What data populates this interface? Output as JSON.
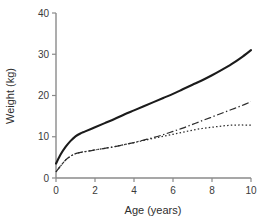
{
  "chart_data": {
    "type": "line",
    "title": "",
    "subtitle": "",
    "xlabel": "Age (years)",
    "ylabel": "Weight (kg)",
    "xlim": [
      0,
      10
    ],
    "ylim": [
      0,
      40
    ],
    "xticks": [
      0,
      2,
      4,
      6,
      8,
      10
    ],
    "yticks": [
      0,
      10,
      20,
      30,
      40
    ],
    "xtick_labels": [
      "0",
      "2",
      "4",
      "6",
      "8",
      "10"
    ],
    "ytick_labels": [
      "0",
      "10",
      "20",
      "30",
      "40"
    ],
    "grid": false,
    "legend": "none",
    "x": [
      0,
      0.25,
      0.5,
      0.75,
      1,
      1.25,
      1.5,
      2,
      2.5,
      3,
      3.5,
      4,
      4.5,
      5,
      5.5,
      6,
      6.5,
      7,
      7.5,
      8,
      8.5,
      9,
      9.5,
      10
    ],
    "series": [
      {
        "name": "solid-curve",
        "style": "solid",
        "color": "#1b1b1b",
        "values": [
          3.5,
          5.8,
          7.6,
          9.0,
          10.1,
          10.8,
          11.3,
          12.3,
          13.3,
          14.3,
          15.4,
          16.4,
          17.4,
          18.4,
          19.4,
          20.4,
          21.5,
          22.6,
          23.7,
          24.9,
          26.2,
          27.6,
          29.2,
          31.0
        ]
      },
      {
        "name": "dash-dot-curve",
        "style": "dash-dot",
        "color": "#2b2b2b",
        "values": [
          1.5,
          3.0,
          4.4,
          5.3,
          5.9,
          6.2,
          6.4,
          6.8,
          7.2,
          7.6,
          8.1,
          8.6,
          9.2,
          9.8,
          10.5,
          11.3,
          12.1,
          13.0,
          13.9,
          14.8,
          15.7,
          16.6,
          17.5,
          18.5
        ]
      },
      {
        "name": "dotted-curve",
        "style": "dotted",
        "color": "#2b2b2b",
        "values": [
          1.5,
          3.0,
          4.4,
          5.3,
          5.9,
          6.2,
          6.4,
          6.8,
          7.2,
          7.6,
          8.1,
          8.6,
          9.1,
          9.6,
          10.1,
          10.6,
          11.1,
          11.6,
          12.0,
          12.3,
          12.6,
          12.8,
          12.85,
          12.8
        ]
      }
    ]
  },
  "axes": {
    "x_title": "Age (years)",
    "y_title": "Weight (kg)"
  }
}
